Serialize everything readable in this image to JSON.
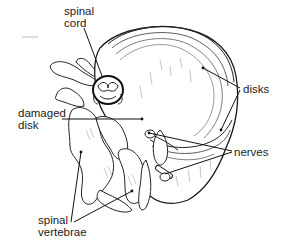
{
  "diagram": {
    "labels": {
      "spinal_cord": [
        "spinal",
        "cord"
      ],
      "disks": "disks",
      "damaged_disk": [
        "damaged",
        "disk"
      ],
      "nerves": "nerves",
      "spinal_vertebrae": [
        "spinal",
        "vertebrae"
      ]
    },
    "colors": {
      "line": "#1a1a1a",
      "fill": "#ffffff",
      "shade": "#cfcfcf",
      "text": "#222222"
    }
  }
}
